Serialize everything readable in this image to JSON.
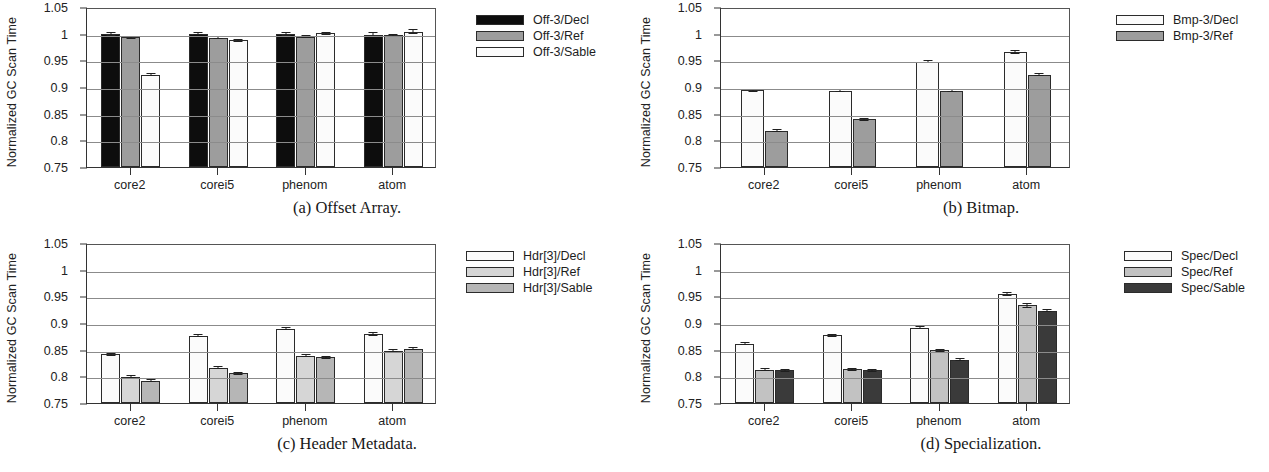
{
  "figure": {
    "y_axis_label": "Normalized GC Scan Time",
    "y_ticks": [
      "1.05",
      "1",
      "0.95",
      "0.9",
      "0.85",
      "0.8",
      "0.75"
    ],
    "categories": [
      "core2",
      "corei5",
      "phenom",
      "atom"
    ]
  },
  "panels": [
    {
      "id": "a",
      "caption": "(a)  Offset Array.",
      "legend": [
        {
          "label": "Off-3/Decl",
          "fill": "#0d0d0d",
          "swatch_class": "f-black"
        },
        {
          "label": "Off-3/Ref",
          "fill": "#9d9d9d",
          "swatch_class": "f-gray"
        },
        {
          "label": "Off-3/Sable",
          "fill": "#fbfbfb",
          "swatch_class": "f-white"
        }
      ]
    },
    {
      "id": "b",
      "caption": "(b)  Bitmap.",
      "legend": [
        {
          "label": "Bmp-3/Decl",
          "fill": "#fbfbfb",
          "swatch_class": "f-white"
        },
        {
          "label": "Bmp-3/Ref",
          "fill": "#9d9d9d",
          "swatch_class": "f-gray"
        }
      ]
    },
    {
      "id": "c",
      "caption": "(c)  Header Metadata.",
      "legend": [
        {
          "label": "Hdr[3]/Decl",
          "fill": "#fbfbfb",
          "swatch_class": "f-white"
        },
        {
          "label": "Hdr[3]/Ref",
          "fill": "#d6d6d6",
          "swatch_class": "f-lgray"
        },
        {
          "label": "Hdr[3]/Sable",
          "fill": "#b6b6b6",
          "swatch_class": "f-mgray"
        }
      ]
    },
    {
      "id": "d",
      "caption": "(d)  Specialization.",
      "legend": [
        {
          "label": "Spec/Decl",
          "fill": "#fbfbfb",
          "swatch_class": "f-white"
        },
        {
          "label": "Spec/Ref",
          "fill": "#c2c2c2",
          "swatch_class": "f-mgray"
        },
        {
          "label": "Spec/Sable",
          "fill": "#3a3a3a",
          "swatch_class": "f-dark"
        }
      ]
    }
  ],
  "chart_data": [
    {
      "type": "bar",
      "panel": "a",
      "title": "(a)  Offset Array.",
      "xlabel": "",
      "ylabel": "Normalized GC Scan Time",
      "ylim": [
        0.75,
        1.05
      ],
      "yticks": [
        0.75,
        0.8,
        0.85,
        0.9,
        0.95,
        1.0,
        1.05
      ],
      "grid": true,
      "legend_position": "right",
      "categories": [
        "core2",
        "corei5",
        "phenom",
        "atom"
      ],
      "series": [
        {
          "name": "Off-3/Decl",
          "values": [
            1.0,
            1.0,
            0.999,
            0.998
          ],
          "errors": [
            0.004,
            0.003,
            0.004,
            0.005
          ],
          "fill": "#0d0d0d"
        },
        {
          "name": "Off-3/Ref",
          "values": [
            0.993,
            0.992,
            0.994,
            0.997
          ],
          "errors": [
            0.002,
            0.002,
            0.003,
            0.003
          ],
          "fill": "#9d9d9d"
        },
        {
          "name": "Off-3/Sable",
          "values": [
            0.923,
            0.988,
            1.001,
            1.004
          ],
          "errors": [
            0.002,
            0.002,
            0.003,
            0.004
          ],
          "fill": "#fbfbfb"
        }
      ]
    },
    {
      "type": "bar",
      "panel": "b",
      "title": "(b)  Bitmap.",
      "xlabel": "",
      "ylabel": "Normalized GC Scan Time",
      "ylim": [
        0.75,
        1.05
      ],
      "yticks": [
        0.75,
        0.8,
        0.85,
        0.9,
        0.95,
        1.0,
        1.05
      ],
      "grid": true,
      "legend_position": "right",
      "categories": [
        "core2",
        "corei5",
        "phenom",
        "atom"
      ],
      "series": [
        {
          "name": "Bmp-3/Decl",
          "values": [
            0.894,
            0.893,
            0.947,
            0.965
          ],
          "errors": [
            0.002,
            0.002,
            0.002,
            0.004
          ],
          "fill": "#fbfbfb"
        },
        {
          "name": "Bmp-3/Ref",
          "values": [
            0.818,
            0.84,
            0.893,
            0.923
          ],
          "errors": [
            0.003,
            0.002,
            0.002,
            0.002
          ],
          "fill": "#9d9d9d"
        }
      ]
    },
    {
      "type": "bar",
      "panel": "c",
      "title": "(c)  Header Metadata.",
      "xlabel": "",
      "ylabel": "Normalized GC Scan Time",
      "ylim": [
        0.75,
        1.05
      ],
      "yticks": [
        0.75,
        0.8,
        0.85,
        0.9,
        0.95,
        1.0,
        1.05
      ],
      "grid": true,
      "legend_position": "right",
      "categories": [
        "core2",
        "corei5",
        "phenom",
        "atom"
      ],
      "series": [
        {
          "name": "Hdr[3]/Decl",
          "values": [
            0.841,
            0.876,
            0.889,
            0.88
          ],
          "errors": [
            0.002,
            0.002,
            0.002,
            0.004
          ],
          "fill": "#fbfbfb"
        },
        {
          "name": "Hdr[3]/Ref",
          "values": [
            0.799,
            0.816,
            0.839,
            0.848
          ],
          "errors": [
            0.002,
            0.002,
            0.002,
            0.002
          ],
          "fill": "#d6d6d6"
        },
        {
          "name": "Hdr[3]/Sable",
          "values": [
            0.792,
            0.806,
            0.836,
            0.852
          ],
          "errors": [
            0.002,
            0.002,
            0.002,
            0.003
          ],
          "fill": "#b6b6b6"
        }
      ]
    },
    {
      "type": "bar",
      "panel": "d",
      "title": "(d)  Specialization.",
      "xlabel": "",
      "ylabel": "Normalized GC Scan Time",
      "ylim": [
        0.75,
        1.05
      ],
      "yticks": [
        0.75,
        0.8,
        0.85,
        0.9,
        0.95,
        1.0,
        1.05
      ],
      "grid": true,
      "legend_position": "right",
      "categories": [
        "core2",
        "corei5",
        "phenom",
        "atom"
      ],
      "series": [
        {
          "name": "Spec/Decl",
          "values": [
            0.861,
            0.877,
            0.891,
            0.954
          ],
          "errors": [
            0.002,
            0.002,
            0.003,
            0.004
          ],
          "fill": "#fbfbfb"
        },
        {
          "name": "Spec/Ref",
          "values": [
            0.812,
            0.813,
            0.849,
            0.933
          ],
          "errors": [
            0.002,
            0.002,
            0.002,
            0.004
          ],
          "fill": "#c2c2c2"
        },
        {
          "name": "Spec/Sable",
          "values": [
            0.811,
            0.811,
            0.831,
            0.923
          ],
          "errors": [
            0.002,
            0.002,
            0.002,
            0.003
          ],
          "fill": "#3a3a3a"
        }
      ]
    }
  ]
}
